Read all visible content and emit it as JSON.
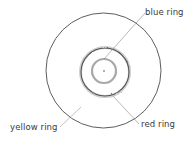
{
  "diagram": {
    "labels": {
      "blue": "blue ring",
      "red": "red ring",
      "yellow": "yellow ring"
    },
    "colors": {
      "outer_ring": "#333333",
      "red_ring": "#555555",
      "blue_ring": "#a8a8a8",
      "leader": "#888888",
      "center_dot": "#999999"
    }
  }
}
